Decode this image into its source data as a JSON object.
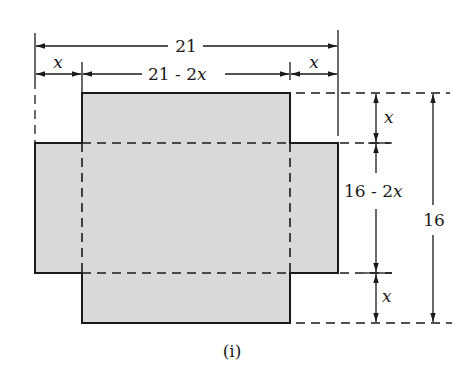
{
  "figure": {
    "caption": "(i)",
    "labels": {
      "total_width": "21",
      "inner_width_prefix": "21 - 2",
      "inner_width_var": "x",
      "cut_left": "x",
      "cut_right": "x",
      "total_height": "16",
      "inner_height_prefix": "16 - 2",
      "inner_height_var": "x",
      "cut_top": "x",
      "cut_bottom": "x"
    },
    "colors": {
      "fill": "#d9d9d9",
      "stroke": "#1a1a1a"
    }
  }
}
